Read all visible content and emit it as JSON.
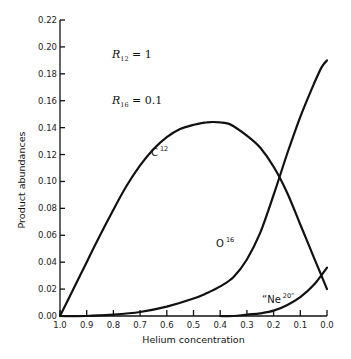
{
  "chart_data": {
    "type": "line",
    "title": "",
    "xlabel": "Helium concentration",
    "ylabel": "Product abundances",
    "xlim": [
      1.0,
      0.0
    ],
    "ylim": [
      0.0,
      0.22
    ],
    "x_reversed": true,
    "grid": false,
    "x_ticks": [
      "1.0",
      "0.9",
      "0.8",
      "0.7",
      "0.6",
      "0.5",
      "0.4",
      "0.3",
      "0.2",
      "0.1",
      "0.0"
    ],
    "y_ticks": [
      "0.00",
      "0.02",
      "0.04",
      "0.06",
      "0.08",
      "0.10",
      "0.12",
      "0.14",
      "0.16",
      "0.18",
      "0.20",
      "0.22"
    ],
    "annotations": [
      {
        "text": "R",
        "sub": "12",
        "rest": " = 1"
      },
      {
        "text": "R",
        "sub": "16",
        "rest": " = 0.1"
      }
    ],
    "series": [
      {
        "name": "C12",
        "label": "C",
        "label_sup": "12",
        "x": [
          1.0,
          0.95,
          0.9,
          0.85,
          0.8,
          0.75,
          0.7,
          0.65,
          0.6,
          0.55,
          0.5,
          0.45,
          0.4,
          0.37,
          0.35,
          0.3,
          0.25,
          0.2,
          0.15,
          0.1,
          0.05,
          0.0
        ],
        "values": [
          0.0,
          0.02,
          0.04,
          0.06,
          0.079,
          0.097,
          0.112,
          0.124,
          0.133,
          0.139,
          0.142,
          0.144,
          0.144,
          0.143,
          0.141,
          0.134,
          0.125,
          0.111,
          0.092,
          0.068,
          0.044,
          0.02
        ]
      },
      {
        "name": "O16",
        "label": "O",
        "label_sup": "16",
        "x": [
          1.0,
          0.9,
          0.8,
          0.7,
          0.6,
          0.5,
          0.45,
          0.4,
          0.35,
          0.3,
          0.25,
          0.2,
          0.15,
          0.1,
          0.05,
          0.02,
          0.0
        ],
        "values": [
          0.0,
          0.0,
          0.001,
          0.003,
          0.007,
          0.013,
          0.017,
          0.022,
          0.029,
          0.042,
          0.062,
          0.09,
          0.12,
          0.148,
          0.172,
          0.185,
          0.19
        ]
      },
      {
        "name": "Ne20",
        "label": "“Ne",
        "label_sup": "20”",
        "x": [
          0.4,
          0.35,
          0.3,
          0.25,
          0.2,
          0.15,
          0.1,
          0.05,
          0.0
        ],
        "values": [
          0.0,
          0.0,
          0.001,
          0.002,
          0.004,
          0.008,
          0.014,
          0.023,
          0.036
        ]
      }
    ]
  }
}
